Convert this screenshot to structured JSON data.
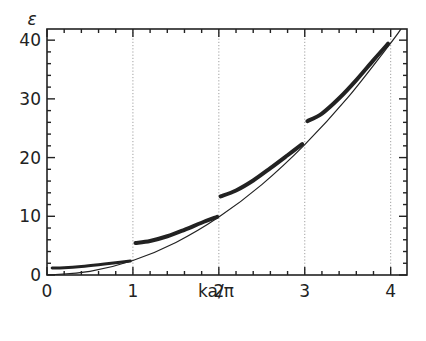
{
  "chart_data": {
    "type": "line",
    "title": "",
    "xlabel": "ka/π",
    "ylabel": "ε",
    "xlim": [
      0,
      4.19
    ],
    "ylim": [
      0,
      41.9
    ],
    "xticks": [
      0,
      1,
      2,
      3,
      4
    ],
    "xtick_labels": [
      "0",
      "1",
      "2",
      "3",
      "4"
    ],
    "yticks": [
      0,
      10,
      20,
      30,
      40
    ],
    "ytick_labels": [
      "0",
      "10",
      "20",
      "30",
      "40"
    ],
    "grid": "dotted vertical lines at x = 1, 2, 3, 4",
    "legend": "none",
    "series": [
      {
        "name": "free-electron parabola",
        "style": "thin line",
        "x": [
          0,
          0.5,
          1,
          1.5,
          2,
          2.5,
          3,
          3.5,
          4,
          4.12
        ],
        "y": [
          0,
          0.62,
          2.47,
          5.55,
          9.87,
          15.4,
          22.2,
          30.2,
          39.5,
          41.9
        ]
      },
      {
        "name": "band 1",
        "style": "thick dots",
        "x": [
          0.06,
          0.2,
          0.4,
          0.6,
          0.8,
          0.97
        ],
        "y": [
          1.2,
          1.25,
          1.45,
          1.75,
          2.1,
          2.4
        ]
      },
      {
        "name": "band 2",
        "style": "thick dots",
        "x": [
          1.03,
          1.2,
          1.4,
          1.6,
          1.8,
          1.98
        ],
        "y": [
          5.45,
          5.8,
          6.6,
          7.7,
          8.9,
          9.9
        ]
      },
      {
        "name": "band 3",
        "style": "thick dots",
        "x": [
          2.02,
          2.2,
          2.4,
          2.6,
          2.8,
          2.97
        ],
        "y": [
          13.4,
          14.4,
          16.1,
          18.2,
          20.4,
          22.3
        ]
      },
      {
        "name": "band 4",
        "style": "thick dots",
        "x": [
          3.03,
          3.2,
          3.4,
          3.6,
          3.8,
          3.97
        ],
        "y": [
          26.2,
          27.5,
          30.1,
          33.2,
          36.6,
          39.4
        ]
      }
    ]
  }
}
